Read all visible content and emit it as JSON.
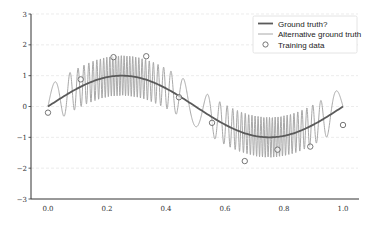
{
  "chart_data": {
    "type": "line",
    "title": "",
    "xlabel": "",
    "ylabel": "",
    "xlim": [
      -0.03,
      1.03
    ],
    "ylim": [
      -3,
      3
    ],
    "grid": "horizontal-dashed",
    "x_ticks": [
      "0.0",
      "0.2",
      "0.4",
      "0.6",
      "0.8",
      "1.0"
    ],
    "x_tick_values": [
      0.0,
      0.2,
      0.4,
      0.6,
      0.8,
      1.0
    ],
    "y_ticks": [
      "3",
      "2",
      "1",
      "0",
      "−1",
      "−2",
      "−3"
    ],
    "y_tick_values": [
      3,
      2,
      1,
      0,
      -1,
      -2,
      -3
    ],
    "legend_position": "upper right",
    "series": [
      {
        "name": "Ground truth?",
        "kind": "line",
        "color": "#5a5a5a",
        "width": 1.8,
        "function": "sin(2*pi*x)",
        "x_range": [
          0,
          1
        ]
      },
      {
        "name": "Alternative ground truth",
        "kind": "line",
        "color": "#a8a8a8",
        "width": 1.0,
        "function": "sin(2*pi*x) + 0.65*sin(chirp phase, frequency higher near x=0.3 and x=0.75)",
        "x_range": [
          0,
          1
        ]
      },
      {
        "name": "Training data",
        "kind": "scatter",
        "marker": "open-circle",
        "color": "#666666",
        "x": [
          0.0,
          0.111,
          0.222,
          0.333,
          0.444,
          0.556,
          0.667,
          0.778,
          0.889,
          1.0
        ],
        "y": [
          -0.2,
          0.88,
          1.6,
          1.63,
          0.3,
          -0.53,
          -1.77,
          -1.4,
          -1.3,
          -0.6
        ]
      }
    ]
  },
  "legend": {
    "items": [
      {
        "label": "Ground truth?",
        "symbol": "line-dark"
      },
      {
        "label": "Alternative ground truth",
        "symbol": "line-light"
      },
      {
        "label": "Training data",
        "symbol": "open-circle"
      }
    ]
  },
  "colors": {
    "axis": "#333333",
    "grid": "#e4e4e4",
    "ground_truth": "#5a5a5a",
    "alternative": "#a8a8a8",
    "marker": "#666666"
  }
}
